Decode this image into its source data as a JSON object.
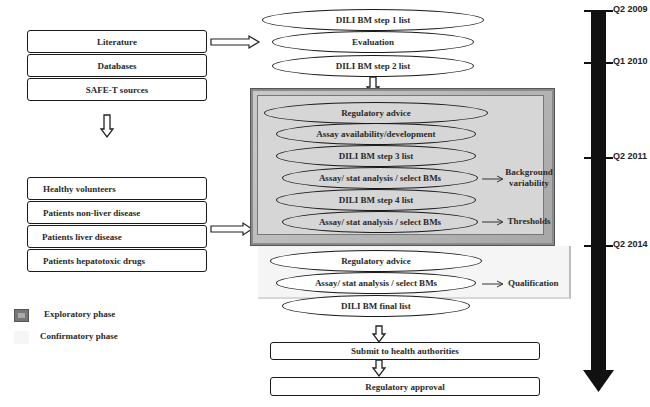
{
  "sources": {
    "top_group": [
      "Literature",
      "Databases",
      "SAFE-T sources"
    ],
    "bottom_group": [
      "Healthy volunteers",
      "Patients non-liver disease",
      "Patients liver disease",
      "Patients hepatotoxic drugs"
    ]
  },
  "initial_steps": [
    "DILI BM step 1 list",
    "Evaluation",
    "DILI BM step 2 list"
  ],
  "exploratory_phase": {
    "steps": [
      "Regulatory advice",
      "Assay availability/development",
      "DILI BM step 3 list",
      "Assay/ stat analysis / select BMs",
      "DILI BM step 4 list",
      "Assay/ stat analysis / select BMs"
    ],
    "outcomes": {
      "background_variability": "Background variability",
      "thresholds": "Thresholds"
    },
    "color": "#d4d4d4"
  },
  "confirmatory_phase": {
    "steps": [
      "Regulatory advice",
      "Assay/ stat analysis / select BMs",
      "DILI BM final list"
    ],
    "outcomes": {
      "qualification": "Qualification"
    },
    "color": "#f5f5f5"
  },
  "final_steps": [
    "Submit to health authorities",
    "Regulatory approval"
  ],
  "legend": {
    "exploratory": "Exploratory phase",
    "confirmatory": "Confirmatory phase"
  },
  "timeline": {
    "milestones": [
      "Q2 2009",
      "Q1 2010",
      "Q2 2011",
      "Q2 2014"
    ],
    "color": "#111111"
  }
}
